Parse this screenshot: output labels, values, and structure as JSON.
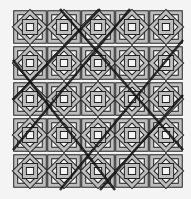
{
  "image": {
    "subject": "interlaced geometric star pattern",
    "tiles": {
      "cols": 5,
      "rows": 5
    },
    "colors": {
      "background": "#f4f4f4",
      "band": "#bdbdbd",
      "outline": "#222222",
      "heavy": "#111111"
    }
  }
}
